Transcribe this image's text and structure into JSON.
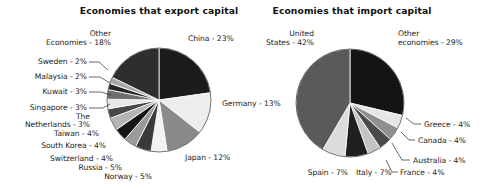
{
  "figure": {
    "background_color": "#ffffff",
    "text_color": "#1a1a1a"
  },
  "chart_data": [
    {
      "type": "pie",
      "id": "export-capital",
      "title": "Economies that export capital",
      "unit": "percent",
      "legend": "none",
      "start_angle_deg": 0,
      "direction": "clockwise",
      "center": [
        159,
        100
      ],
      "radius": 52,
      "categories": [
        "China",
        "Germany",
        "Japan",
        "Norway",
        "Russia",
        "Switzerland",
        "South Korea",
        "Taiwan",
        "The Netherlands",
        "Singapore",
        "Kuwait",
        "Malaysia",
        "Sweden",
        "Other Economies"
      ],
      "values": [
        23,
        13,
        12,
        5,
        5,
        4,
        4,
        4,
        3,
        3,
        3,
        2,
        2,
        18
      ],
      "labels": [
        "China - 23%",
        "Germany - 13%",
        "Japan - 12%",
        "Norway - 5%",
        "Russia - 5%",
        "Switzerland - 4%",
        "South Korea - 4%",
        "Taiwan - 4%",
        "The Netherlands - 3%",
        "Singapore - 3%",
        "Kuwait - 3%",
        "Malaysia - 2%",
        "Sweden - 2%",
        "Other Economies - 18%"
      ],
      "colors": [
        "#1c1c1c",
        "#ededed",
        "#8a8a8a",
        "#f2f2f2",
        "#3a3a3a",
        "#9a9a9a",
        "#151515",
        "#b5b5b5",
        "#484848",
        "#e8e8e8",
        "#6e6e6e",
        "#262626",
        "#a8a8a8",
        "#2e2e2e"
      ]
    },
    {
      "type": "pie",
      "id": "import-capital",
      "title": "Economies that import capital",
      "unit": "percent",
      "legend": "none",
      "start_angle_deg": 0,
      "direction": "clockwise",
      "center": [
        350,
        103
      ],
      "radius": 54,
      "categories": [
        "Other economies",
        "Greece",
        "Canada",
        "Australia",
        "France",
        "Italy",
        "Spain",
        "United States"
      ],
      "values": [
        29,
        4,
        4,
        4,
        4,
        7,
        7,
        42
      ],
      "labels": [
        "Other economies - 29%",
        "Greece - 4%",
        "Canada - 4%",
        "Australia - 4%",
        "France - 4%",
        "Italy - 7%",
        "Spain - 7%",
        "United States - 42%"
      ],
      "colors": [
        "#141414",
        "#e6e6e6",
        "#8f8f8f",
        "#4a4a4a",
        "#c4c4c4",
        "#1f1f1f",
        "#dcdcdc",
        "#5a5a5a"
      ]
    }
  ],
  "annotations": {
    "left": {
      "title_x": 159,
      "title_y": 14,
      "labels": [
        {
          "key": "china",
          "text": "China - 23%",
          "x": 188,
          "y": 41,
          "anchor": "start"
        },
        {
          "key": "germany",
          "text": "Germany - 13%",
          "x": 222,
          "y": 106,
          "anchor": "start"
        },
        {
          "key": "japan",
          "text": "Japan - 12%",
          "x": 185,
          "y": 160,
          "anchor": "start"
        },
        {
          "key": "norway",
          "text": "Norway - 5%",
          "x": 152,
          "y": 179,
          "anchor": "end"
        },
        {
          "key": "russia",
          "text": "Russia - 5%",
          "x": 122,
          "y": 170,
          "anchor": "end"
        },
        {
          "key": "switzerland",
          "text": "Switzerland - 4%",
          "x": 113,
          "y": 161,
          "anchor": "end"
        },
        {
          "key": "south-korea",
          "text": "South Korea - 4%",
          "x": 106,
          "y": 148,
          "anchor": "end"
        },
        {
          "key": "taiwan",
          "text": "Taiwan - 4%",
          "x": 99,
          "y": 136,
          "anchor": "end"
        },
        {
          "key": "netherlands-1",
          "text": "The",
          "x": 90,
          "y": 119,
          "anchor": "end"
        },
        {
          "key": "netherlands-2",
          "text": "Netherlands - 3%",
          "x": 90,
          "y": 127,
          "anchor": "end"
        },
        {
          "key": "singapore",
          "text": "Singapore - 3%",
          "x": 87,
          "y": 110,
          "anchor": "end"
        },
        {
          "key": "kuwait",
          "text": "Kuwait - 3%",
          "x": 87,
          "y": 94,
          "anchor": "end"
        },
        {
          "key": "malaysia",
          "text": "Malaysia - 2%",
          "x": 87,
          "y": 79,
          "anchor": "end"
        },
        {
          "key": "sweden",
          "text": "Sweden - 2%",
          "x": 87,
          "y": 64,
          "anchor": "end"
        },
        {
          "key": "other-1",
          "text": "Other",
          "x": 111,
          "y": 36,
          "anchor": "end"
        },
        {
          "key": "other-2",
          "text": "Economies - 18%",
          "x": 111,
          "y": 45,
          "anchor": "end"
        }
      ]
    },
    "right": {
      "title_x": 352,
      "title_y": 14,
      "labels": [
        {
          "key": "united-states-1",
          "text": "United",
          "x": 314,
          "y": 36,
          "anchor": "end"
        },
        {
          "key": "united-states-2",
          "text": "States - 42%",
          "x": 314,
          "y": 45,
          "anchor": "end"
        },
        {
          "key": "other-1",
          "text": "Other",
          "x": 398,
          "y": 36,
          "anchor": "start"
        },
        {
          "key": "other-2",
          "text": "economies - 29%",
          "x": 398,
          "y": 45,
          "anchor": "start"
        },
        {
          "key": "greece",
          "text": "Greece - 4%",
          "x": 424,
          "y": 127,
          "anchor": "start"
        },
        {
          "key": "canada",
          "text": "Canada - 4%",
          "x": 418,
          "y": 143,
          "anchor": "start"
        },
        {
          "key": "australia",
          "text": "Australia - 4%",
          "x": 413,
          "y": 163,
          "anchor": "start"
        },
        {
          "key": "france",
          "text": "France - 4%",
          "x": 400,
          "y": 175,
          "anchor": "start"
        },
        {
          "key": "italy",
          "text": "Italy - 7%",
          "x": 356,
          "y": 175,
          "anchor": "start"
        },
        {
          "key": "spain",
          "text": "Spain - 7%",
          "x": 348,
          "y": 175,
          "anchor": "end"
        }
      ]
    }
  }
}
